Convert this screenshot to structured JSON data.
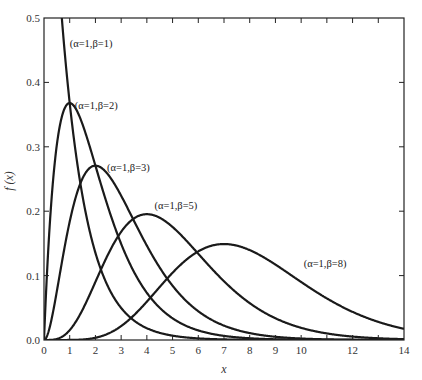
{
  "chart_data": {
    "type": "line",
    "title": "",
    "xlabel": "x",
    "ylabel": "f (x)",
    "xlim": [
      0,
      14
    ],
    "ylim": [
      0,
      0.5
    ],
    "grid": false,
    "legend": "inline labels",
    "x_ticks": [
      0,
      1,
      2,
      3,
      4,
      5,
      6,
      7,
      8,
      9,
      10,
      11,
      12,
      13,
      14
    ],
    "x_tick_labels": [
      "0",
      "1",
      "2",
      "3",
      "4",
      "5",
      "6",
      "7",
      "8",
      "9",
      "10",
      "",
      "12",
      "",
      "14"
    ],
    "y_ticks": [
      0,
      0.1,
      0.2,
      0.3,
      0.4,
      0.5
    ],
    "y_tick_labels": [
      "0.0",
      "0.1",
      "0.2",
      "0.3",
      "0.4",
      "0.5"
    ],
    "series": [
      {
        "name": "(α=1,β=1)",
        "alpha": 1,
        "beta": 1,
        "peak_x": 0,
        "peak_y": 1.0,
        "label_x": 1.0,
        "label_y": 0.455
      },
      {
        "name": "(α=1,β=2)",
        "alpha": 1,
        "beta": 2,
        "peak_x": 1,
        "peak_y": 0.368,
        "label_x": 1.2,
        "label_y": 0.358
      },
      {
        "name": "(α=1,β=3)",
        "alpha": 1,
        "beta": 3,
        "peak_x": 2,
        "peak_y": 0.271,
        "label_x": 2.45,
        "label_y": 0.263
      },
      {
        "name": "(α=1,β=5)",
        "alpha": 1,
        "beta": 5,
        "peak_x": 4,
        "peak_y": 0.195,
        "label_x": 4.3,
        "label_y": 0.204
      },
      {
        "name": "(α=1,β=8)",
        "alpha": 1,
        "beta": 8,
        "peak_x": 7,
        "peak_y": 0.149,
        "label_x": 10.1,
        "label_y": 0.114
      }
    ]
  }
}
